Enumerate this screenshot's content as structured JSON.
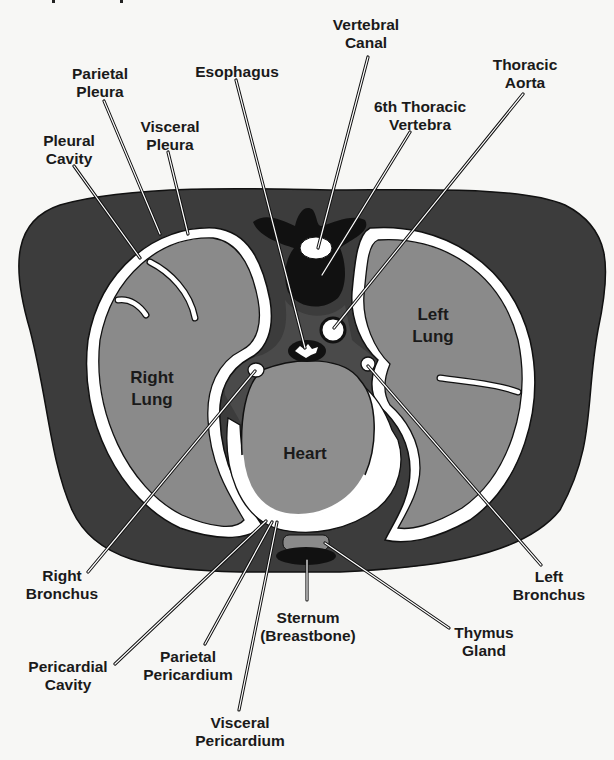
{
  "diagram": {
    "type": "anatomical cross-section",
    "colors": {
      "background": "#f7f7f5",
      "body_wall": "#3c3c3c",
      "lung": "#8a8a8a",
      "heart": "#8e8e8e",
      "membrane": "#ffffff",
      "bone": "#111111",
      "mediastinum": "#4a4a4a",
      "outline": "#111111"
    },
    "organ_labels": {
      "right_lung": [
        "Right",
        "Lung"
      ],
      "left_lung": [
        "Left",
        "Lung"
      ],
      "heart": [
        "Heart"
      ]
    },
    "callouts": [
      {
        "id": "vertebral-canal",
        "lines": [
          "Vertebral",
          "Canal"
        ]
      },
      {
        "id": "esophagus",
        "lines": [
          "Esophagus"
        ]
      },
      {
        "id": "parietal-pleura",
        "lines": [
          "Parietal",
          "Pleura"
        ]
      },
      {
        "id": "thoracic-aorta",
        "lines": [
          "Thoracic",
          "Aorta"
        ]
      },
      {
        "id": "sixth-thoracic-vertebra",
        "lines": [
          "6th Thoracic",
          "Vertebra"
        ]
      },
      {
        "id": "pleural-cavity",
        "lines": [
          "Pleural",
          "Cavity"
        ]
      },
      {
        "id": "visceral-pleura",
        "lines": [
          "Visceral",
          "Pleura"
        ]
      },
      {
        "id": "right-bronchus",
        "lines": [
          "Right",
          "Bronchus"
        ]
      },
      {
        "id": "left-bronchus",
        "lines": [
          "Left",
          "Bronchus"
        ]
      },
      {
        "id": "sternum",
        "lines": [
          "Sternum",
          "(Breastbone)"
        ]
      },
      {
        "id": "thymus-gland",
        "lines": [
          "Thymus",
          "Gland"
        ]
      },
      {
        "id": "pericardial-cavity",
        "lines": [
          "Pericardial",
          "Cavity"
        ]
      },
      {
        "id": "parietal-pericardium",
        "lines": [
          "Parietal",
          "Pericardium"
        ]
      },
      {
        "id": "visceral-pericardium",
        "lines": [
          "Visceral",
          "Pericardium"
        ]
      }
    ]
  }
}
